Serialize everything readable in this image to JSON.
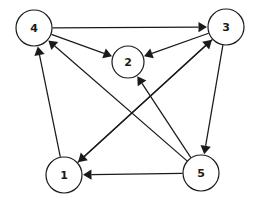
{
  "figure": {
    "background_color": "#ffffff",
    "stroke_color": "#1a1a1a",
    "width": 260,
    "height": 205
  },
  "graph_data": {
    "type": "directed-graph",
    "directed": true,
    "node_count": 5,
    "edge_count": 10,
    "nodes": [
      {
        "id": "4",
        "label": "4",
        "cx": 34,
        "cy": 28,
        "r": 18
      },
      {
        "id": "3",
        "label": "3",
        "cx": 226,
        "cy": 27,
        "r": 18
      },
      {
        "id": "2",
        "label": "2",
        "cx": 128,
        "cy": 62,
        "r": 16
      },
      {
        "id": "1",
        "label": "1",
        "cx": 64,
        "cy": 175,
        "r": 18
      },
      {
        "id": "5",
        "label": "5",
        "cx": 201,
        "cy": 173,
        "r": 18
      }
    ],
    "edges": [
      {
        "from": "4",
        "to": "3",
        "label": "4 to 3"
      },
      {
        "from": "4",
        "to": "2",
        "label": "4 to 2"
      },
      {
        "from": "3",
        "to": "2",
        "label": "3 to 2"
      },
      {
        "from": "3",
        "to": "1",
        "label": "3 to 1"
      },
      {
        "from": "3",
        "to": "5",
        "label": "3 to 5"
      },
      {
        "from": "1",
        "to": "4",
        "label": "1 to 4"
      },
      {
        "from": "1",
        "to": "3",
        "label": "1 to 3"
      },
      {
        "from": "5",
        "to": "4",
        "label": "5 to 4"
      },
      {
        "from": "5",
        "to": "2",
        "label": "5 to 2"
      },
      {
        "from": "5",
        "to": "1",
        "label": "5 to 1"
      }
    ]
  }
}
